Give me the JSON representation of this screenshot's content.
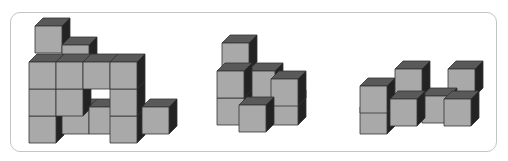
{
  "caption": "",
  "colors": {
    "front": "#a9a9a9",
    "top": "#595959",
    "side": "#232323",
    "edge": "#333333",
    "frame": "#c4c4c4"
  },
  "cube": {
    "size": 27,
    "dx": 8,
    "dy": 8
  },
  "figures": [
    {
      "name": "figure-left",
      "cubes": [
        [
          35,
          26
        ],
        [
          62,
          45
        ],
        [
          29,
          116
        ],
        [
          29,
          89
        ],
        [
          29,
          62
        ],
        [
          62,
          107
        ],
        [
          56,
          89
        ],
        [
          56,
          62
        ],
        [
          89,
          107
        ],
        [
          83,
          62
        ],
        [
          110,
          116
        ],
        [
          110,
          89
        ],
        [
          110,
          62
        ],
        [
          142,
          107
        ]
      ]
    },
    {
      "name": "figure-middle",
      "cubes": [
        [
          222,
          43
        ],
        [
          248,
          71
        ],
        [
          217,
          98
        ],
        [
          217,
          71
        ],
        [
          271,
          98
        ],
        [
          271,
          79
        ],
        [
          239,
          105
        ]
      ]
    },
    {
      "name": "figure-right",
      "cubes": [
        [
          360,
          107
        ],
        [
          360,
          86
        ],
        [
          395,
          69
        ],
        [
          448,
          69
        ],
        [
          422,
          96
        ],
        [
          390,
          99
        ],
        [
          444,
          99
        ]
      ]
    }
  ]
}
